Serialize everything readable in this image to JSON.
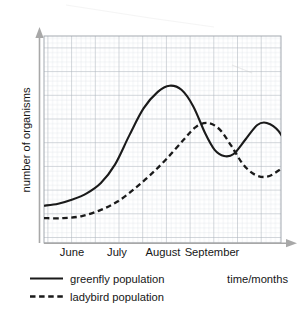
{
  "chart_data": {
    "type": "line",
    "title": "",
    "xlabel": "time/months",
    "ylabel": "number of organisms",
    "grid": "graph-paper minor and major gridlines, no numeric scale",
    "legend_position": "below-axis-left",
    "x_tick_labels": [
      "June",
      "July",
      "August",
      "September"
    ],
    "y_tick_labels": [],
    "xlim": [
      0,
      100
    ],
    "ylim": [
      0,
      100
    ],
    "series": [
      {
        "name": "greenfly population",
        "style": "solid",
        "color": "#1a1a1a",
        "points": [
          {
            "x": 0,
            "y": 18
          },
          {
            "x": 6,
            "y": 19
          },
          {
            "x": 12,
            "y": 21
          },
          {
            "x": 18,
            "y": 24
          },
          {
            "x": 24,
            "y": 29
          },
          {
            "x": 30,
            "y": 38
          },
          {
            "x": 36,
            "y": 52
          },
          {
            "x": 42,
            "y": 65
          },
          {
            "x": 48,
            "y": 73
          },
          {
            "x": 53,
            "y": 76
          },
          {
            "x": 58,
            "y": 74
          },
          {
            "x": 63,
            "y": 66
          },
          {
            "x": 68,
            "y": 53
          },
          {
            "x": 72,
            "y": 45
          },
          {
            "x": 76,
            "y": 42
          },
          {
            "x": 80,
            "y": 43
          },
          {
            "x": 85,
            "y": 50
          },
          {
            "x": 90,
            "y": 57
          },
          {
            "x": 94,
            "y": 58
          },
          {
            "x": 99,
            "y": 54
          },
          {
            "x": 104,
            "y": 43
          },
          {
            "x": 108,
            "y": 28
          },
          {
            "x": 111,
            "y": 18
          }
        ]
      },
      {
        "name": "ladybird population",
        "style": "dashed",
        "color": "#1a1a1a",
        "points": [
          {
            "x": 0,
            "y": 12
          },
          {
            "x": 8,
            "y": 12
          },
          {
            "x": 16,
            "y": 13
          },
          {
            "x": 24,
            "y": 16
          },
          {
            "x": 31,
            "y": 20
          },
          {
            "x": 38,
            "y": 26
          },
          {
            "x": 45,
            "y": 33
          },
          {
            "x": 52,
            "y": 41
          },
          {
            "x": 59,
            "y": 50
          },
          {
            "x": 64,
            "y": 56
          },
          {
            "x": 69,
            "y": 58
          },
          {
            "x": 74,
            "y": 55
          },
          {
            "x": 79,
            "y": 47
          },
          {
            "x": 84,
            "y": 38
          },
          {
            "x": 89,
            "y": 33
          },
          {
            "x": 94,
            "y": 32
          },
          {
            "x": 99,
            "y": 35
          },
          {
            "x": 104,
            "y": 40
          },
          {
            "x": 108,
            "y": 43
          },
          {
            "x": 111,
            "y": 42
          }
        ]
      }
    ]
  },
  "axes": {
    "y_axis_title": "number of organisms",
    "x_axis_title": "time/months",
    "month_labels": [
      {
        "text": "June",
        "x": 72
      },
      {
        "text": "July",
        "x": 117
      },
      {
        "text": "August",
        "x": 163
      },
      {
        "text": "September",
        "x": 212
      }
    ]
  },
  "legend": {
    "items": [
      {
        "label": "greenfly population",
        "style": "solid"
      },
      {
        "label": "ladybird population",
        "style": "dashed"
      }
    ]
  },
  "colors": {
    "curve": "#1a1a1a",
    "grid_minor": "#d8dde3",
    "grid_major": "#aab0b8",
    "grid_border": "#9aa0a8",
    "axis_arrow": "#a8a8a8",
    "text": "#161616",
    "background": "#ffffff"
  }
}
